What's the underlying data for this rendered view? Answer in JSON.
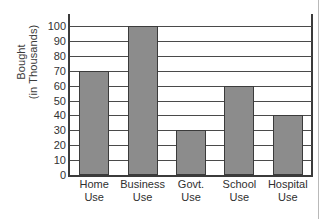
{
  "chart_data": {
    "type": "bar",
    "title": "",
    "xlabel": "",
    "ylabel": "Bought (in Thousands)",
    "ylabel_lines": [
      "Bought",
      "(in Thousands)"
    ],
    "categories": [
      "Home Use",
      "Business Use",
      "Govt. Use",
      "School Use",
      "Hospital Use"
    ],
    "category_lines": [
      [
        "Home",
        "Use"
      ],
      [
        "Business",
        "Use"
      ],
      [
        "Govt.",
        "Use"
      ],
      [
        "School",
        "Use"
      ],
      [
        "Hospital",
        "Use"
      ]
    ],
    "values": [
      70,
      100,
      30,
      60,
      40
    ],
    "ylim": [
      0,
      100
    ],
    "ytick_step": 10,
    "yticks": [
      0,
      10,
      20,
      30,
      40,
      50,
      60,
      70,
      80,
      90,
      100
    ],
    "ytick_labels": [
      "0",
      "10",
      "20",
      "30",
      "40",
      "50",
      "60",
      "70",
      "80",
      "90",
      "100"
    ],
    "grid": true,
    "grid_orientation": "horizontal",
    "legend": false,
    "legend_position": "none",
    "bar_fill_color": "#8c8c8c",
    "bar_border_color": "#3b3b3b",
    "grid_color": "#4a4a4a",
    "axis_color": "#3b3b3b",
    "background_color": "#ffffff"
  }
}
